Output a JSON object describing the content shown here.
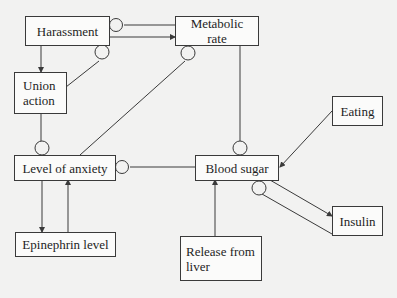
{
  "diagram": {
    "type": "causal-loop",
    "colors": {
      "background": "#f2f2f1",
      "stroke": "#3a3a3a",
      "text": "#1e1e1e",
      "box_fill": "#fbfbfa"
    },
    "nodes": [
      {
        "id": "harassment",
        "label": "Harassment"
      },
      {
        "id": "metabolic_rate",
        "label": "Metabolic rate"
      },
      {
        "id": "union_action",
        "label": "Union\naction"
      },
      {
        "id": "level_of_anxiety",
        "label": "Level of anxiety"
      },
      {
        "id": "epinephrin_level",
        "label": "Epinephrin level"
      },
      {
        "id": "blood_sugar",
        "label": "Blood sugar"
      },
      {
        "id": "eating",
        "label": "Eating"
      },
      {
        "id": "insulin",
        "label": "Insulin"
      },
      {
        "id": "release_from_liver",
        "label": "Release from\nliver"
      }
    ],
    "edges": [
      {
        "from": "harassment",
        "to": "metabolic_rate",
        "type": "arrow"
      },
      {
        "from": "metabolic_rate",
        "to": "harassment",
        "type": "inhibit"
      },
      {
        "from": "harassment",
        "to": "union_action",
        "type": "arrow"
      },
      {
        "from": "union_action",
        "to": "harassment",
        "type": "inhibit"
      },
      {
        "from": "union_action",
        "to": "level_of_anxiety",
        "type": "inhibit"
      },
      {
        "from": "level_of_anxiety",
        "to": "metabolic_rate",
        "type": "inhibit"
      },
      {
        "from": "metabolic_rate",
        "to": "blood_sugar",
        "type": "inhibit"
      },
      {
        "from": "blood_sugar",
        "to": "level_of_anxiety",
        "type": "inhibit"
      },
      {
        "from": "level_of_anxiety",
        "to": "epinephrin_level",
        "type": "arrow"
      },
      {
        "from": "epinephrin_level",
        "to": "level_of_anxiety",
        "type": "arrow"
      },
      {
        "from": "eating",
        "to": "blood_sugar",
        "type": "arrow"
      },
      {
        "from": "release_from_liver",
        "to": "blood_sugar",
        "type": "arrow"
      },
      {
        "from": "blood_sugar",
        "to": "insulin",
        "type": "arrow"
      },
      {
        "from": "insulin",
        "to": "blood_sugar",
        "type": "inhibit"
      }
    ]
  }
}
